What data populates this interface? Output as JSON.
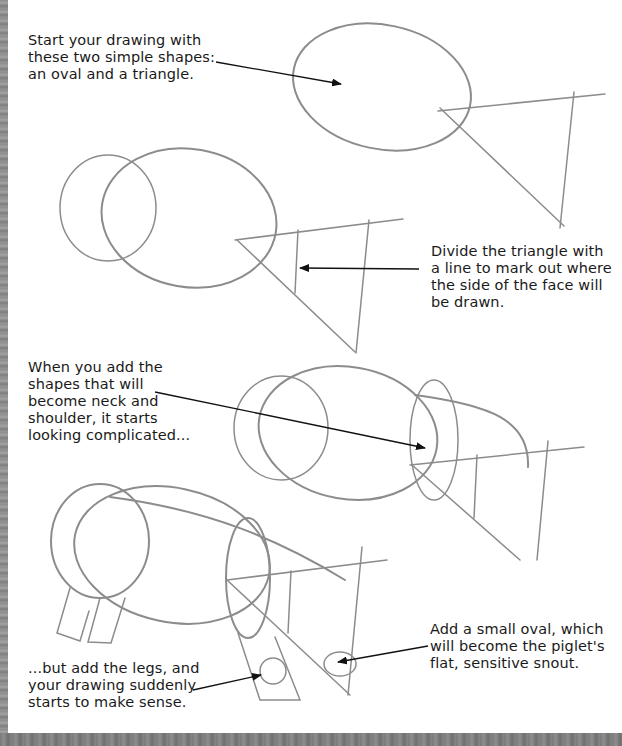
{
  "captions": {
    "step1": "Start your drawing with\nthese two simple shapes:\nan oval and a triangle.",
    "step2": "Divide the triangle with\na line to mark out where\nthe side of the face will\nbe drawn.",
    "step3": "When you add the\nshapes that will\nbecome neck and\nshoulder, it starts\nlooking complicated...",
    "step4": "...but add the legs, and\nyour drawing suddenly\nstarts to make sense.",
    "step5": "Add a small oval, which\nwill become the piglet's\nflat, sensitive snout."
  },
  "illustrations": [
    {
      "id": "step1-oval-triangle",
      "description": "oval and triangle"
    },
    {
      "id": "step2-divided-triangle",
      "description": "two ovals with divided triangle"
    },
    {
      "id": "step3-neck-shoulder",
      "description": "neck and shoulder shapes added"
    },
    {
      "id": "step4-legs-snout",
      "description": "legs and snout oval added"
    }
  ],
  "colors": {
    "pencil": "#8c8c8c",
    "text": "#1a1a1a",
    "arrow": "#111111",
    "edge_strip": "#8a8a8a"
  }
}
